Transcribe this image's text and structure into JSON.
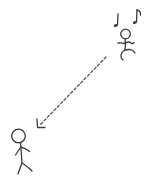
{
  "illustration": {
    "description": "Hand-drawn sketch: a dancing stick figure with musical notes in the upper right, a dashed arrow pointing down-left to a standing stick figure in the lower left.",
    "colors": {
      "background": "#ffffff",
      "ink": "#3a3a3a",
      "dashed_line": "#555555"
    },
    "elements": {
      "dancing_figure": {
        "label": "dancing stick figure"
      },
      "music_notes": {
        "label": "musical notes",
        "count": 2
      },
      "arrow": {
        "label": "dashed arrow",
        "direction": "down-left"
      },
      "standing_figure": {
        "label": "standing stick figure"
      }
    }
  }
}
